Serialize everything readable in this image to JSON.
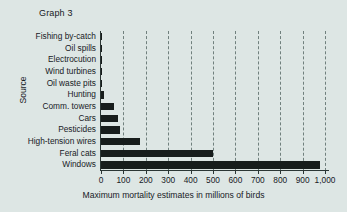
{
  "chart_data": {
    "type": "bar",
    "orientation": "horizontal",
    "title": "Graph 3",
    "xlabel": "Maximum mortality estimates in millions of birds",
    "ylabel": "Source",
    "categories": [
      "Fishing by-catch",
      "Oil spills",
      "Electrocution",
      "Wind turbines",
      "Oil waste pits",
      "Hunting",
      "Comm. towers",
      "Cars",
      "Pesticides",
      "High-tension wires",
      "Feral cats",
      "Windows"
    ],
    "values": [
      3,
      3,
      4,
      4,
      5,
      15,
      60,
      75,
      85,
      175,
      500,
      977
    ],
    "xlim": [
      0,
      1000
    ],
    "tick_values": [
      0,
      100,
      200,
      300,
      400,
      500,
      600,
      700,
      800,
      900,
      1000
    ],
    "tick_labels": [
      "0",
      "100",
      "200",
      "300",
      "400",
      "500",
      "600",
      "700",
      "800",
      "900",
      "1,000"
    ],
    "grid": "vertical-dashed",
    "legend": "none",
    "bar_color": "#171d1c",
    "background_color": "#dde6e4",
    "axis_color": "#2b3634",
    "gridline_color": "#5d6f6c"
  }
}
